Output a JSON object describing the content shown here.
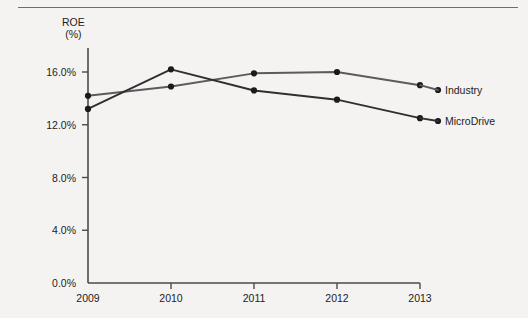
{
  "chart_data": {
    "type": "line",
    "title": "",
    "ylabel": "ROE",
    "yunit": "(%)",
    "xlabel": "",
    "categories": [
      "2009",
      "2010",
      "2011",
      "2012",
      "2013"
    ],
    "ylim": [
      0,
      18
    ],
    "yticks": [
      0,
      4,
      8,
      12,
      16
    ],
    "ytick_labels": [
      "0.0%",
      "4.0%",
      "8.0%",
      "12.0%",
      "16.0%"
    ],
    "grid": false,
    "legend_position": "right-inline",
    "series": [
      {
        "name": "Industry",
        "color": "#5b5b5e",
        "values": [
          14.2,
          14.9,
          15.9,
          16.0,
          15.0
        ]
      },
      {
        "name": "MicroDrive",
        "color": "#2f2f33",
        "values": [
          13.2,
          16.2,
          14.6,
          13.9,
          12.5
        ]
      }
    ]
  },
  "figure": {
    "axis_color": "#4a4a4d",
    "background": "#f4f3f1",
    "marker_color": "#1a1a1a"
  }
}
